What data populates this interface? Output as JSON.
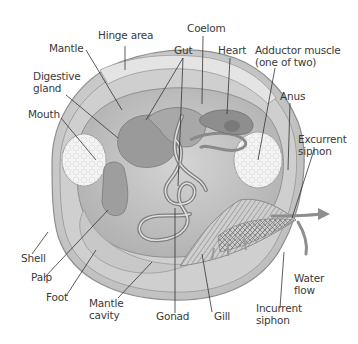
{
  "diagram": {
    "colors": {
      "shell": "#d8d8d8",
      "shell_edge": "#9a9a9a",
      "body": "#c4c4c4",
      "organ_dark": "#8c8c8c",
      "muscle": "#f2f2f2",
      "leader": "#333333",
      "arrow": "#8a8a8a",
      "text": "#3a3a3a"
    },
    "labels": {
      "hinge_area": "Hinge area",
      "mantle": "Mantle",
      "digestive_gland": "Digestive\ngland",
      "mouth": "Mouth",
      "gut": "Gut",
      "coelom": "Coelom",
      "heart": "Heart",
      "adductor_muscle": "Adductor muscle\n(one of two)",
      "anus": "Anus",
      "excurrent_siphon": "Excurrent\nsiphon",
      "shell": "Shell",
      "palp": "Palp",
      "foot": "Foot",
      "mantle_cavity": "Mantle\ncavity",
      "gonad": "Gonad",
      "gill": "Gill",
      "water_flow": "Water\nflow",
      "incurrent_siphon": "Incurrent\nsiphon"
    }
  }
}
